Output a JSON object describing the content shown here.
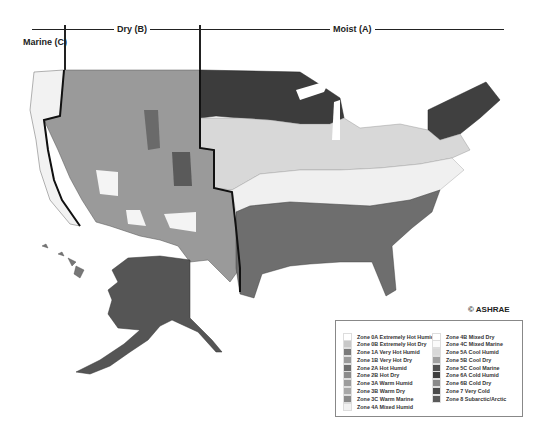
{
  "header": {
    "marine_label": "Marine (C)",
    "dry_label": "Dry (B)",
    "moist_label": "Moist (A)"
  },
  "copyright": "© ASHRAE",
  "legend": {
    "left": [
      {
        "label": "Zone 0A Extremely Hot Humid",
        "color": "#ffffff"
      },
      {
        "label": "Zone 0B Extremely Hot Dry",
        "color": "#c8c8c8"
      },
      {
        "label": "Zone 1A Very Hot Humid",
        "color": "#7a7a7a"
      },
      {
        "label": "Zone 1B Very Hot Dry",
        "color": "#9a9a9a"
      },
      {
        "label": "Zone 2A Hot Humid",
        "color": "#6e6e6e"
      },
      {
        "label": "Zone 2B Hot Dry",
        "color": "#8c8c8c"
      },
      {
        "label": "Zone 3A Warm Humid",
        "color": "#9c9c9c"
      },
      {
        "label": "Zone 3B Warm Dry",
        "color": "#a8a8a8"
      },
      {
        "label": "Zone 3C Warm Marine",
        "color": "#8a8a8a"
      },
      {
        "label": "Zone 4A Mixed Humid",
        "color": "#f2f2f2"
      }
    ],
    "right": [
      {
        "label": "Zone 4B Mixed Dry",
        "color": "#ffffff"
      },
      {
        "label": "Zone 4C Mixed Marine",
        "color": "#fafafa"
      },
      {
        "label": "Zone 5A Cool Humid",
        "color": "#d8d8d8"
      },
      {
        "label": "Zone 5B Cool Dry",
        "color": "#a0a0a0"
      },
      {
        "label": "Zone 5C Cool Marine",
        "color": "#505050"
      },
      {
        "label": "Zone 6A Cold Humid",
        "color": "#3e3e3e"
      },
      {
        "label": "Zone 6B Cold Dry",
        "color": "#8a8a8a"
      },
      {
        "label": "Zone 7 Very Cold",
        "color": "#4a4a4a"
      },
      {
        "label": "Zone 8 Subarctic/Arctic",
        "color": "#5a5a5a"
      }
    ]
  }
}
